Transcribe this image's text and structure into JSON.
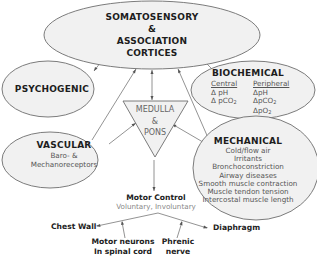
{
  "diagram": {
    "nodes": {
      "cortices": {
        "line1": "SOMATOSENSORY",
        "line2": "&",
        "line3": "ASSOCIATION",
        "line4": "CORTICES"
      },
      "psychogenic": {
        "title": "PSYCHOGENIC"
      },
      "biochemical": {
        "title": "BIOCHEMICAL",
        "central_label": "Central",
        "central_items": [
          "Δ pH",
          "Δ pCO"
        ],
        "peripheral_label": "Peripheral",
        "peripheral_items": [
          "ΔpH",
          "ΔpCO",
          "ΔpO"
        ],
        "subscript": "2"
      },
      "medulla": {
        "line1": "MEDULLA",
        "line2": "&",
        "line3": "PONS"
      },
      "vascular": {
        "title": "VASCULAR",
        "line1": "Baro- &",
        "line2": "Mechanoreceptors"
      },
      "mechanical": {
        "title": "MECHANICAL",
        "items": [
          "Cold/flow air",
          "Irritants",
          "Bronchoconstriction",
          "Airway diseases",
          "Smooth muscle contraction",
          "Muscle tendon tension",
          "Intercostal muscle length"
        ]
      },
      "motor_control": {
        "title": "Motor Control",
        "subtitle": "Voluntary, Involuntary"
      },
      "chest_wall": {
        "label": "Chest Wall"
      },
      "diaphragm": {
        "label": "Diaphragm"
      },
      "motor_neurons": {
        "line1": "Motor neurons",
        "line2": "In spinal cord"
      },
      "phrenic": {
        "line1": "Phrenic",
        "line2": "nerve"
      }
    },
    "edges": [
      {
        "from": "psychogenic",
        "to": "cortices",
        "type": "bidirectional"
      },
      {
        "from": "biochemical",
        "to": "cortices",
        "type": "directed"
      },
      {
        "from": "medulla",
        "to": "cortices",
        "type": "bidirectional"
      },
      {
        "from": "vascular",
        "to": "cortices",
        "type": "directed"
      },
      {
        "from": "mechanical",
        "to": "cortices",
        "type": "directed"
      },
      {
        "from": "vascular",
        "to": "medulla",
        "type": "directed"
      },
      {
        "from": "mechanical",
        "to": "medulla",
        "type": "directed"
      },
      {
        "from": "medulla",
        "to": "motor_control",
        "type": "directed"
      },
      {
        "from": "motor_control",
        "to": "chest_wall",
        "type": "directed"
      },
      {
        "from": "motor_control",
        "to": "diaphragm",
        "type": "directed"
      },
      {
        "from": "motor_neurons",
        "to": "chest_wall_path",
        "type": "directed"
      },
      {
        "from": "phrenic",
        "to": "diaphragm_path",
        "type": "directed"
      }
    ]
  }
}
